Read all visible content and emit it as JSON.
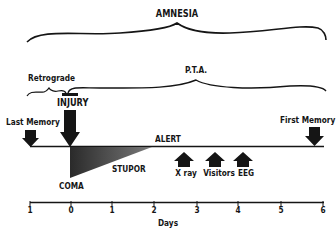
{
  "diagram": {
    "title_top": "AMNESIA",
    "pta_label": "P.T.A.",
    "retrograde_label": "Retrograde",
    "injury_label": "INJURY",
    "last_memory_label": "Last Memory",
    "first_memory_label": "First Memory",
    "alert_label": "ALERT",
    "stupor_label": "STUPOR",
    "coma_label": "COMA",
    "events": [
      {
        "label": "X ray"
      },
      {
        "label": "Visitors"
      },
      {
        "label": "EEG"
      }
    ],
    "axis": {
      "label": "Days",
      "ticks": [
        "1",
        "0",
        "1",
        "2",
        "3",
        "4",
        "5",
        "6"
      ]
    },
    "colors": {
      "ink": "#151515",
      "fill_dark": "#2e2e2e",
      "fill_light": "#8a8a8a"
    }
  }
}
